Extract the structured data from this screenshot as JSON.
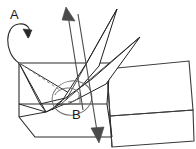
{
  "diagram": {
    "type": "line-art-fold-diagram",
    "style": {
      "stroke": "#1f1f1f",
      "stroke_light": "#5a5a5a",
      "dashed_stroke": "#8a8a8a",
      "background": "#ffffff",
      "stroke_width_main": 1,
      "stroke_width_thin": 0.8
    },
    "labels": [
      {
        "id": "A",
        "text": "A",
        "x": 10,
        "y": 8,
        "meaning": "rotation-axis-label-a"
      },
      {
        "id": "B",
        "text": "B",
        "x": 72,
        "y": 108,
        "meaning": "rotation-axis-label-b"
      }
    ],
    "annotations": {
      "rotation_arrow_a": "curved loop arrow below label A indicating rotation about left edge",
      "rotation_ellipse_b": "ellipse loop around point B indicating rotation about pivot B",
      "motion_arrow_up": "straight arrow pointing up-left out of the fold",
      "motion_arrow_down": "straight arrow pointing down out of the fold"
    },
    "geometry": {
      "left_box": {
        "name": "left-open-box",
        "points": "18,62 18,120 30,136 100,136 100,80 112,62"
      },
      "right_panel_top": {
        "name": "right-panel-top",
        "points": "120,66 190,60 192,112 122,117"
      },
      "right_panel_bottom": {
        "name": "right-panel-bottom",
        "points": "122,117 192,112 193,141 124,146"
      },
      "spikes": [
        {
          "name": "spike-upper",
          "tip_x": 118,
          "tip_y": 8
        },
        {
          "name": "spike-lower",
          "tip_x": 140,
          "tip_y": 36
        }
      ]
    }
  }
}
